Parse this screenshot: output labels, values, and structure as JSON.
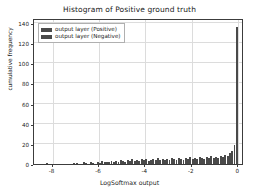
{
  "chart_data": {
    "type": "bar",
    "title": "Histogram of Positive ground truth",
    "xlabel": "LogSoftmax output",
    "ylabel": "cumulative frequency",
    "xlim": [
      -8.8,
      0.25
    ],
    "ylim": [
      0,
      145
    ],
    "grid": true,
    "legend_position": "upper left",
    "xticks": [
      -8,
      -6,
      -4,
      -2,
      0
    ],
    "xtick_labels": [
      "-8",
      "-6",
      "-4",
      "-2",
      "0"
    ],
    "yticks": [
      0,
      20,
      40,
      60,
      80,
      100,
      120,
      140
    ],
    "ytick_labels": [
      "0",
      "20",
      "40",
      "60",
      "80",
      "100",
      "120",
      "140"
    ],
    "bin_width": 0.1,
    "series": [
      {
        "name": "output layer (Positive)",
        "color": "#4a4a4a",
        "x": [
          -8.25,
          -7.05,
          -6.95,
          -6.65,
          -6.55,
          -6.35,
          -6.25,
          -6.05,
          -5.95,
          -5.85,
          -5.75,
          -5.65,
          -5.55,
          -5.45,
          -5.35,
          -5.25,
          -5.15,
          -5.05,
          -4.95,
          -4.85,
          -4.75,
          -4.65,
          -4.55,
          -4.45,
          -4.35,
          -4.25,
          -4.15,
          -4.05,
          -3.95,
          -3.85,
          -3.75,
          -3.65,
          -3.55,
          -3.45,
          -3.35,
          -3.25,
          -3.15,
          -3.05,
          -2.95,
          -2.85,
          -2.75,
          -2.65,
          -2.55,
          -2.45,
          -2.35,
          -2.25,
          -2.15,
          -2.05,
          -1.95,
          -1.85,
          -1.75,
          -1.65,
          -1.55,
          -1.45,
          -1.35,
          -1.25,
          -1.15,
          -1.05,
          -0.95,
          -0.85,
          -0.75,
          -0.65,
          -0.55,
          -0.45,
          -0.35,
          -0.25,
          -0.15,
          -0.05
        ],
        "values": [
          1,
          1,
          1,
          2,
          1,
          2,
          1,
          2,
          1,
          3,
          2,
          2,
          2,
          3,
          2,
          3,
          2,
          4,
          3,
          2,
          4,
          3,
          5,
          3,
          4,
          3,
          5,
          4,
          5,
          3,
          4,
          5,
          4,
          6,
          4,
          5,
          4,
          5,
          4,
          6,
          5,
          4,
          6,
          5,
          4,
          6,
          5,
          7,
          5,
          6,
          5,
          7,
          6,
          5,
          7,
          6,
          8,
          6,
          7,
          6,
          8,
          7,
          9,
          8,
          11,
          13,
          19,
          136
        ]
      },
      {
        "name": "output layer (Negative)",
        "color": "#4a4a4a",
        "x": [],
        "values": []
      }
    ]
  },
  "legend": {
    "entries": [
      {
        "label": "output layer (Positive)",
        "color": "#4a4a4a"
      },
      {
        "label": "output layer (Negative)",
        "color": "#4a4a4a"
      }
    ]
  }
}
